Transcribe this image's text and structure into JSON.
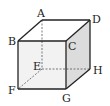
{
  "diagram": {
    "type": "cube",
    "vertices": {
      "A": {
        "label": "A",
        "x": 42,
        "y": 20
      },
      "B": {
        "label": "B",
        "x": 18,
        "y": 41
      },
      "C": {
        "label": "C",
        "x": 66,
        "y": 41
      },
      "D": {
        "label": "D",
        "x": 90,
        "y": 20
      },
      "E": {
        "label": "E",
        "x": 42,
        "y": 69
      },
      "F": {
        "label": "F",
        "x": 18,
        "y": 89
      },
      "G": {
        "label": "G",
        "x": 66,
        "y": 89
      },
      "H": {
        "label": "H",
        "x": 90,
        "y": 69
      }
    },
    "hidden_edges": [
      "AE",
      "EF",
      "EH"
    ],
    "colors": {
      "edge": "#222222",
      "front_face": "#f2f2f2",
      "right_face": "#dcdcdc",
      "hidden_edge": "#555555"
    }
  }
}
